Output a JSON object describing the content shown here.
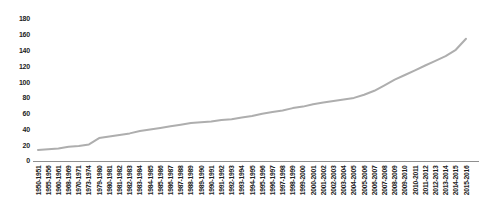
{
  "chart_data": {
    "type": "line",
    "categories": [
      "1950-1951",
      "1955-1956",
      "1960-1961",
      "1968-1969",
      "1970-1971",
      "1973-1974",
      "1979-1980",
      "1980-1981",
      "1981-1982",
      "1982-1983",
      "1983-1984",
      "1984-1985",
      "1985-1986",
      "1986-1987",
      "1987-1988",
      "1988-1989",
      "1989-1990",
      "1990-1991",
      "1991-1992",
      "1992-1993",
      "1993-1994",
      "1994-1995",
      "1995-1996",
      "1996-1997",
      "1997-1998",
      "1998-1999",
      "1999-2000",
      "2000-2001",
      "2001-2002",
      "2002-2003",
      "2003-2004",
      "2004-2005",
      "2005-2006",
      "2006-2007",
      "2007-2008",
      "2008-2009",
      "2009-2010",
      "2010-2011",
      "2011-2012",
      "2012-2013",
      "2013-2014",
      "2014-2015",
      "2015-2016"
    ],
    "series": [
      {
        "name": "value",
        "values": [
          14,
          15,
          16,
          18,
          19,
          21,
          29,
          31,
          33,
          35,
          38,
          40,
          42,
          44,
          46,
          48,
          49,
          50,
          52,
          53,
          55,
          57,
          60,
          62,
          64,
          67,
          69,
          72,
          74,
          76,
          78,
          80,
          84,
          89,
          96,
          103,
          109,
          115,
          121,
          127,
          133,
          141,
          155
        ]
      }
    ],
    "title": "",
    "xlabel": "",
    "ylabel": "",
    "ylim": [
      0,
      180
    ],
    "ytick_step": 20,
    "ytick_labels": [
      "0",
      "20",
      "40",
      "60",
      "80",
      "100",
      "120",
      "140",
      "160",
      "180"
    ],
    "grid": false,
    "legend": false,
    "line_color": "#aeaeae",
    "axis_color": "#8f8f8f",
    "text_color": "#1c1c1c",
    "background_color": "#ffffff"
  }
}
